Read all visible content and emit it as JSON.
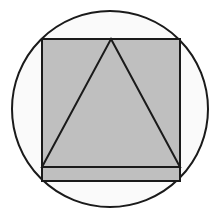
{
  "canvas": {
    "width": 220,
    "height": 221,
    "background_color": "#ffffff",
    "title": "Circle with inscribed square and triangle"
  },
  "palette": {
    "stroke_color": "#1a1a1a",
    "shape_fill_gray": "#bfbfbf",
    "circle_fill": "#fafafa",
    "page_background": "#ffffff"
  },
  "shapes": {
    "circle": {
      "label": "circle",
      "cx": 110,
      "cy": 109,
      "r": 98,
      "fill": "#fafafa",
      "stroke": "#1a1a1a",
      "stroke_width": 2
    },
    "square": {
      "label": "square",
      "x": 42,
      "y": 39,
      "width": 138,
      "height": 128,
      "fill": "#bfbfbf",
      "stroke": "#1a1a1a",
      "stroke_width": 2
    },
    "triangle": {
      "label": "triangle",
      "points": "111,39 180,167 42,167",
      "apex_x": 111,
      "apex_y": 39,
      "base_left_x": 42,
      "base_right_x": 180,
      "base_y": 167,
      "fill": "#bfbfbf",
      "stroke": "#1a1a1a",
      "stroke_width": 2
    },
    "bottom_band": {
      "label": "bottom-band",
      "x": 42,
      "y": 167,
      "width": 138,
      "height": 14,
      "fill": "#bfbfbf",
      "stroke": "#1a1a1a",
      "stroke_width": 2
    }
  }
}
